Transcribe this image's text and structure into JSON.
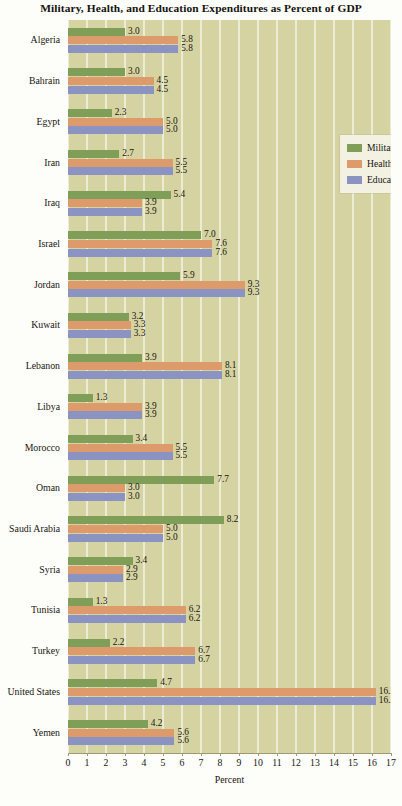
{
  "chart_data": {
    "type": "bar",
    "orientation": "horizontal",
    "title": "Military, Health, and Education Expenditures as Percent of GDP",
    "xlabel": "Percent",
    "ylabel": "",
    "xlim": [
      0,
      17
    ],
    "xticks": [
      "0",
      "1",
      "2",
      "3",
      "4",
      "5",
      "6",
      "7",
      "8",
      "9",
      "10",
      "11",
      "12",
      "13",
      "14",
      "15",
      "16",
      "17"
    ],
    "grid": true,
    "legend_position": "upper-right-inside",
    "categories": [
      "Algeria",
      "Bahrain",
      "Egypt",
      "Iran",
      "Iraq",
      "Israel",
      "Jordan",
      "Kuwait",
      "Lebanon",
      "Libya",
      "Morocco",
      "Oman",
      "Saudi Arabia",
      "Syria",
      "Tunisia",
      "Turkey",
      "United States",
      "Yemen"
    ],
    "series": [
      {
        "name": "Military",
        "color": "#7f9e58",
        "values": [
          3.0,
          3.0,
          2.3,
          2.7,
          5.4,
          7.0,
          5.9,
          3.2,
          3.9,
          1.3,
          3.4,
          7.7,
          8.2,
          3.4,
          1.3,
          2.2,
          4.7,
          4.2
        ],
        "labels": [
          "3.0",
          "3.0",
          "2.3",
          "2.7",
          "5.4",
          "7.0",
          "5.9",
          "3.2",
          "3.9",
          "1.3",
          "3.4",
          "7.7",
          "8.2",
          "3.4",
          "1.3",
          "2.2",
          "4.7",
          "4.2"
        ]
      },
      {
        "name": "Health",
        "color": "#dd9a6b",
        "values": [
          5.8,
          4.5,
          5.0,
          5.5,
          3.9,
          7.6,
          9.3,
          3.3,
          8.1,
          3.9,
          5.5,
          3.0,
          5.0,
          2.9,
          6.2,
          6.7,
          16.2,
          5.6
        ],
        "labels": [
          "5.8",
          "4.5",
          "5.0",
          "5.5",
          "3.9",
          "7.6",
          "9.3",
          "3.3",
          "8.1",
          "3.9",
          "5.5",
          "3.0",
          "5.0",
          "2.9",
          "6.2",
          "6.7",
          "16.2",
          "5.6"
        ]
      },
      {
        "name": "Education",
        "color": "#8b93c2",
        "values": [
          5.8,
          4.5,
          5.0,
          5.5,
          3.9,
          7.6,
          9.3,
          3.3,
          8.1,
          3.9,
          5.5,
          3.0,
          5.0,
          2.9,
          6.2,
          6.7,
          16.2,
          5.6
        ],
        "labels": [
          "5.8",
          "4.5",
          "5.0",
          "5.5",
          "3.9",
          "7.6",
          "9.3",
          "3.3",
          "8.1",
          "3.9",
          "5.5",
          "3.0",
          "5.0",
          "2.9",
          "6.2",
          "6.7",
          "16.2",
          "5.6"
        ]
      }
    ]
  },
  "legend": {
    "entries": [
      {
        "label": "Military",
        "color": "#7f9e58"
      },
      {
        "label": "Health",
        "color": "#dd9a6b"
      },
      {
        "label": "Education",
        "color": "#8b93c2"
      }
    ]
  },
  "colors": {
    "plot_background": "#d6d3a2",
    "gridline": "#fffffc",
    "legend_background": "#f3f1e2",
    "text": "#17150f",
    "military": "#7f9e58",
    "health": "#dd9a6b",
    "education": "#8b93c2"
  }
}
